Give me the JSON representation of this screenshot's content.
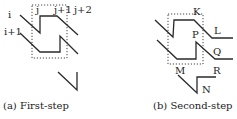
{
  "panels": [
    {
      "id": "a",
      "caption": "(a) First-step",
      "row_labels": [
        "i",
        "i+1"
      ],
      "col_labels": [
        "j",
        "j+1",
        "j+2"
      ]
    },
    {
      "id": "b",
      "caption": "(b) Second-step",
      "point_labels": {
        "K": "K",
        "L": "L",
        "P": "P",
        "Q": "Q",
        "M": "M",
        "R": "R",
        "N": "N"
      }
    }
  ],
  "colors": {
    "stroke": "#2a2a2a",
    "background": "#ffffff"
  }
}
